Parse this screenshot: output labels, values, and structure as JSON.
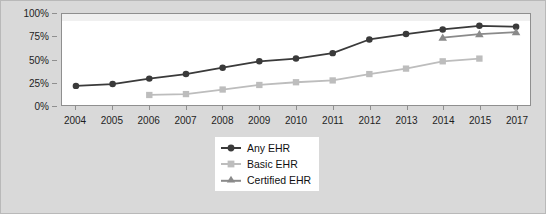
{
  "chart_data": {
    "type": "line",
    "title": "",
    "subtitle": "",
    "xlabel": "",
    "ylabel": "",
    "x": [
      "2004",
      "2005",
      "2006",
      "2007",
      "2008",
      "2009",
      "2010",
      "2011",
      "2012",
      "2013",
      "2014",
      "2015",
      "2017"
    ],
    "categories": [
      "2004",
      "2005",
      "2006",
      "2007",
      "2008",
      "2009",
      "2010",
      "2011",
      "2012",
      "2013",
      "2014",
      "2015",
      "2017"
    ],
    "xtick_labels": [
      "2004",
      "2005",
      "2006",
      "2007",
      "2008",
      "2009",
      "2010",
      "2011",
      "2012",
      "2013",
      "2014",
      "2015",
      "2017"
    ],
    "ytick_labels": [
      "0%",
      "25%",
      "50%",
      "75%",
      "100%"
    ],
    "ytick_values": [
      0,
      25,
      50,
      75,
      100
    ],
    "ylim": [
      0,
      100
    ],
    "grid": false,
    "legend_position": "below-center",
    "series": [
      {
        "name": "Any EHR",
        "marker": "circle",
        "color": "#3a3a3a",
        "values": [
          21,
          23,
          29,
          34,
          41,
          48,
          51,
          57,
          72,
          78,
          83,
          87,
          86
        ]
      },
      {
        "name": "Basic EHR",
        "marker": "square",
        "color": "#bdbdbd",
        "values": [
          null,
          null,
          11,
          12,
          17,
          22,
          25,
          27,
          34,
          40,
          48,
          51,
          null
        ]
      },
      {
        "name": "Certified EHR",
        "marker": "triangle",
        "color": "#8a8a8a",
        "values": [
          null,
          null,
          null,
          null,
          null,
          null,
          null,
          null,
          null,
          null,
          74,
          78,
          80
        ]
      }
    ]
  },
  "legend": {
    "items": [
      {
        "label": "Any EHR"
      },
      {
        "label": "Basic EHR"
      },
      {
        "label": "Certified EHR"
      }
    ]
  },
  "colors": {
    "figure_background": "#d9d9d9",
    "plot_background": "#ffffff",
    "axis": "#8f8f8f",
    "any_ehr": "#3a3a3a",
    "basic_ehr": "#bdbdbd",
    "certified_ehr": "#8a8a8a"
  }
}
